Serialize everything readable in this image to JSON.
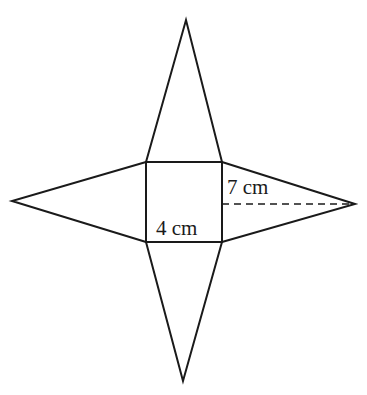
{
  "figure": {
    "labels": {
      "base_side": "4 cm",
      "slant_height": "7 cm"
    },
    "colors": {
      "stroke": "#1a1a1a",
      "background": "#ffffff"
    }
  }
}
